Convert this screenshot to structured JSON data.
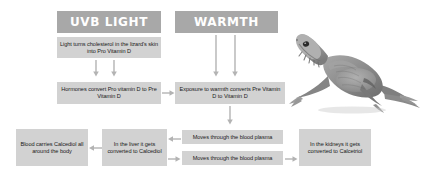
{
  "diagram": {
    "colors": {
      "header_fill": "#a8a8a8",
      "box_fill": "#d2d2d2",
      "arrow": "#b3b3b3",
      "text": "#1a1a1a",
      "header_text": "#ffffff",
      "background": "#ffffff"
    },
    "headers": [
      {
        "id": "uvb",
        "label": "UVB LIGHT"
      },
      {
        "id": "warmth",
        "label": "WARMTH"
      }
    ],
    "boxes": [
      {
        "id": "box-uvb-step1",
        "text": "Light turns cholesterol in the lizard's skin into Pro Vitamin D"
      },
      {
        "id": "box-hormones",
        "text": "Hormones convert Pro vitamin D to Pre Vitamin D"
      },
      {
        "id": "box-warmth-step1",
        "text": "Exposure to warmth converts Pre Vitamin D to Vitamin D"
      },
      {
        "id": "box-blood-carries",
        "text": "Blood carries Calcediol all around the body"
      },
      {
        "id": "box-liver",
        "text": "In the liver it gets converted to Calcediol"
      },
      {
        "id": "box-plasma-upper",
        "text": "Moves through the blood plasma"
      },
      {
        "id": "box-plasma-lower",
        "text": "Moves through the blood plasma"
      },
      {
        "id": "box-kidneys",
        "text": "In the kidneys it gets converted to Calcetriol"
      }
    ],
    "arrows": [
      {
        "id": "arrow-uvb-down-left",
        "direction": "down"
      },
      {
        "id": "arrow-uvb-down-right",
        "direction": "down"
      },
      {
        "id": "arrow-warmth-down-left",
        "direction": "down"
      },
      {
        "id": "arrow-warmth-down-right",
        "direction": "down"
      },
      {
        "id": "arrow-hormones-to-warmth",
        "direction": "right"
      },
      {
        "id": "arrow-warmth-to-plasma",
        "direction": "down"
      },
      {
        "id": "arrow-plasma-upper-to-liver",
        "direction": "left"
      },
      {
        "id": "arrow-liver-to-blood",
        "direction": "left"
      },
      {
        "id": "arrow-liver-to-plasma-lower",
        "direction": "right"
      },
      {
        "id": "arrow-plasma-lower-to-kidneys",
        "direction": "right"
      }
    ],
    "image": {
      "id": "lizard-photo",
      "subject": "bearded dragon lizard"
    }
  }
}
